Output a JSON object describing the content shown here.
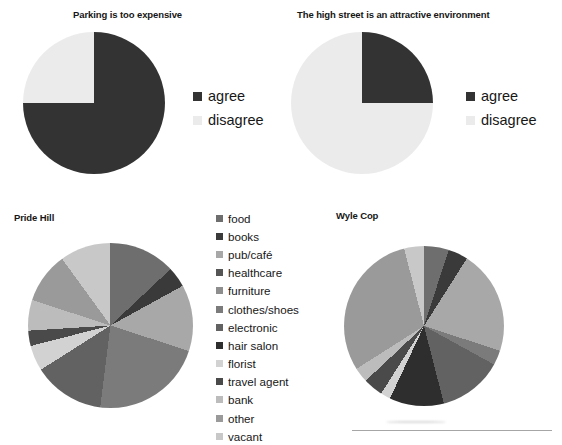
{
  "charts": [
    {
      "id": "parking-too-expensive",
      "title": "Parking is too expensive",
      "legend": [
        {
          "label": "agree",
          "color": "#333333"
        },
        {
          "label": "disagree",
          "color": "#ebebeb"
        }
      ]
    },
    {
      "id": "high-street-attractive",
      "title": "The high street is an attractive environment",
      "legend": [
        {
          "label": "agree",
          "color": "#333333"
        },
        {
          "label": "disagree",
          "color": "#ebebeb"
        }
      ]
    },
    {
      "id": "pride-hill",
      "title": "Pride Hill"
    },
    {
      "id": "wyle-cop",
      "title": "Wyle Cop"
    }
  ],
  "category_legend": [
    {
      "label": "food",
      "color": "#6e6e6e"
    },
    {
      "label": "books",
      "color": "#3a3a3a"
    },
    {
      "label": "pub/café",
      "color": "#a8a8a8"
    },
    {
      "label": "healthcare",
      "color": "#555555"
    },
    {
      "label": "furniture",
      "color": "#8e8e8e"
    },
    {
      "label": "clothes/shoes",
      "color": "#7b7b7b"
    },
    {
      "label": "electronic",
      "color": "#626262"
    },
    {
      "label": "hair salon",
      "color": "#2e2e2e"
    },
    {
      "label": "florist",
      "color": "#d2d2d2"
    },
    {
      "label": "travel agent",
      "color": "#4a4a4a"
    },
    {
      "label": "bank",
      "color": "#bcbcbc"
    },
    {
      "label": "other",
      "color": "#9a9a9a"
    },
    {
      "label": "vacant",
      "color": "#c8c8c8"
    }
  ],
  "chart_data": [
    {
      "type": "pie",
      "title": "Parking is too expensive",
      "categories": [
        "agree",
        "disagree"
      ],
      "values": [
        75,
        25
      ],
      "unit": "percent",
      "colors": [
        "#333333",
        "#ebebeb"
      ],
      "legend_position": "right",
      "start_angle_deg": 0,
      "direction": "clockwise"
    },
    {
      "type": "pie",
      "title": "The high street is an attractive environment",
      "categories": [
        "agree",
        "disagree"
      ],
      "values": [
        25,
        75
      ],
      "unit": "percent",
      "colors": [
        "#333333",
        "#ebebeb"
      ],
      "legend_position": "right",
      "start_angle_deg": 0,
      "direction": "clockwise"
    },
    {
      "type": "pie",
      "title": "Pride Hill",
      "categories": [
        "food",
        "books",
        "pub/café",
        "healthcare",
        "furniture",
        "clothes/shoes",
        "electronic",
        "hair salon",
        "florist",
        "travel agent",
        "bank",
        "other",
        "vacant"
      ],
      "values": [
        13,
        4,
        13,
        0,
        0,
        22,
        14,
        0,
        5,
        3,
        6,
        10,
        10
      ],
      "unit": "percent",
      "colors": [
        "#6e6e6e",
        "#3a3a3a",
        "#a8a8a8",
        "#555555",
        "#8e8e8e",
        "#7b7b7b",
        "#626262",
        "#2e2e2e",
        "#d2d2d2",
        "#4a4a4a",
        "#bcbcbc",
        "#9a9a9a",
        "#c8c8c8"
      ],
      "legend_position": "left-shared",
      "start_angle_deg": 0,
      "direction": "clockwise"
    },
    {
      "type": "pie",
      "title": "Wyle Cop",
      "categories": [
        "food",
        "books",
        "pub/café",
        "healthcare",
        "furniture",
        "clothes/shoes",
        "electronic",
        "hair salon",
        "florist",
        "travel agent",
        "bank",
        "other",
        "vacant"
      ],
      "values": [
        5,
        4,
        21,
        0,
        0,
        3,
        13,
        11,
        2,
        4,
        3,
        30,
        4
      ],
      "unit": "percent",
      "colors": [
        "#6e6e6e",
        "#3a3a3a",
        "#a8a8a8",
        "#555555",
        "#8e8e8e",
        "#7b7b7b",
        "#626262",
        "#2e2e2e",
        "#d2d2d2",
        "#4a4a4a",
        "#bcbcbc",
        "#9a9a9a",
        "#c8c8c8"
      ],
      "legend_position": "left-shared",
      "start_angle_deg": 0,
      "direction": "clockwise"
    }
  ]
}
